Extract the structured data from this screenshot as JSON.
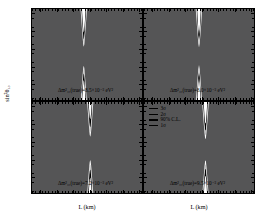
{
  "figure": {
    "ylabel": "sin²θ₁₃",
    "xlabel": "L (km)"
  },
  "axes": {
    "y_ticks": [
      "0.22",
      "0.24",
      "0.26",
      "0.28",
      "0.3",
      "0.32"
    ],
    "x_ticks_left": [
      "40",
      "50",
      "60",
      "70",
      "80",
      "90",
      "100"
    ],
    "x_ticks_right": [
      "40",
      "50",
      "60",
      "70",
      "80",
      "90",
      "100"
    ]
  },
  "legend": {
    "items": [
      {
        "label": "3σ"
      },
      {
        "label": "2σ"
      },
      {
        "label": "90% C.L."
      },
      {
        "label": "1σ"
      }
    ]
  },
  "panels": [
    {
      "id": "top-left",
      "annotation": "Δm²₃₁(true)=8.5×10⁻³ eV²"
    },
    {
      "id": "top-right",
      "annotation": "Δm²₃₁(true)=8.0×10⁻³ eV²"
    },
    {
      "id": "bottom-left",
      "annotation": "Δm²₃₁(true)=7.2×10⁻³ eV²"
    },
    {
      "id": "bottom-right",
      "annotation": "Δm²₃₁(true)=9.5×10⁻³ eV²"
    }
  ],
  "colors": {
    "level_3sigma": "#000000",
    "level_2sigma": "#bdbdbd",
    "level_90cl": "#ffffff",
    "level_1sigma": "#555556",
    "background": "#555556",
    "axis": "#000000"
  },
  "chart_data": {
    "type": "contour",
    "title": "",
    "xlabel": "L (km)",
    "ylabel": "sin²θ₁₃",
    "xlim": [
      35,
      103
    ],
    "ylim": [
      0.22,
      0.325
    ],
    "grid": false,
    "legend_position": "inside bottom-right panel, top-left corner",
    "confidence_levels": [
      "1σ",
      "90% C.L.",
      "2σ",
      "3σ"
    ],
    "panels": [
      {
        "id": "top-left",
        "dm2_true": 0.0085,
        "dm2_units": "eV²",
        "annotation": "Δm²₃₁(true)=8.5×10⁻³ eV²",
        "waist_center_y": 0.2705,
        "waist_half_width": 0.0105,
        "asymptote_x": 67,
        "flare": 0.00072
      },
      {
        "id": "top-right",
        "dm2_true": 0.008,
        "dm2_units": "eV²",
        "annotation": "Δm²₃₁(true)=8.0×10⁻³ eV²",
        "waist_center_y": 0.2705,
        "waist_half_width": 0.01,
        "asymptote_x": 69,
        "flare": 0.0007
      },
      {
        "id": "bottom-left",
        "dm2_true": 0.0072,
        "dm2_units": "eV²",
        "annotation": "Δm²₃₁(true)=7.2×10⁻³ eV²",
        "waist_center_y": 0.2715,
        "waist_half_width": 0.013,
        "asymptote_x": 71,
        "flare": 0.00074
      },
      {
        "id": "bottom-right",
        "dm2_true": 0.0095,
        "dm2_units": "eV²",
        "annotation": "Δm²₃₁(true)=9.5×10⁻³ eV²",
        "waist_center_y": 0.27,
        "waist_half_width": 0.0115,
        "asymptote_x": 73,
        "flare": 0.00068
      }
    ]
  }
}
